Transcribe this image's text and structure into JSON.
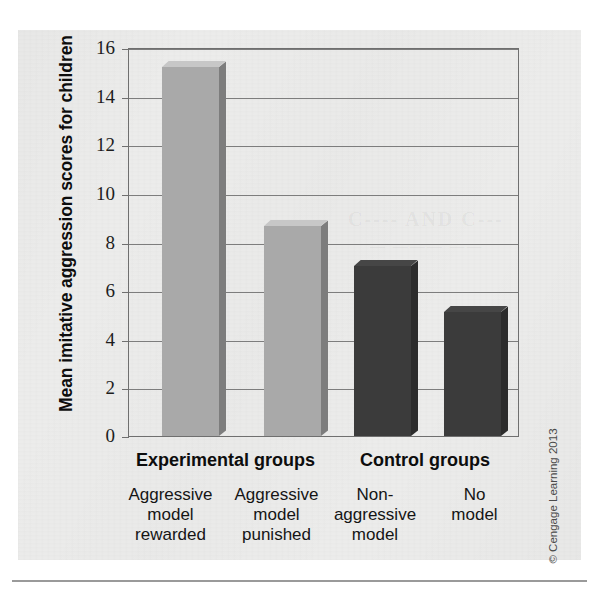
{
  "figure": {
    "credit": "© Cengage Learning 2013",
    "background_bleed": [
      "C---- AND C---",
      "—  ——— ——"
    ]
  },
  "chart_data": {
    "type": "bar",
    "title": "",
    "xlabel": "",
    "ylabel": "Mean imitative aggression scores for children",
    "ylim": [
      0,
      16
    ],
    "yticks": [
      0,
      2,
      4,
      6,
      8,
      10,
      12,
      14,
      16
    ],
    "ytick_labels": [
      "0",
      "2",
      "4",
      "6",
      "8",
      "10",
      "12",
      "14",
      "16"
    ],
    "grid": true,
    "legend": "none",
    "categories": [
      "Aggressive model rewarded",
      "Aggressive model punished",
      "Non-aggressive model",
      "No model"
    ],
    "category_lines": [
      [
        "Aggressive",
        "model",
        "rewarded"
      ],
      [
        "Aggressive",
        "model",
        "punished"
      ],
      [
        "Non-",
        "aggressive",
        "model"
      ],
      [
        "No",
        "model"
      ]
    ],
    "values": [
      15.2,
      8.65,
      7.0,
      5.1
    ],
    "bar_colors": [
      "#a9a9a9",
      "#a9a9a9",
      "#3b3b3b",
      "#3b3b3b"
    ],
    "groups": [
      {
        "label": "Experimental groups",
        "members": [
          0,
          1
        ]
      },
      {
        "label": "Control groups",
        "members": [
          2,
          3
        ]
      }
    ]
  },
  "colors": {
    "experimental_bar": "#a9a9a9",
    "control_bar": "#3b3b3b",
    "axis": "#6f6f6f",
    "grid": "#7d7d7d",
    "paper": "#ececeb",
    "text": "#0d0d0d"
  }
}
